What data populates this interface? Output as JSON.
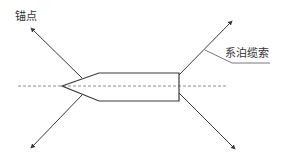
{
  "diagram": {
    "type": "mooring-schematic",
    "labels": {
      "anchor_point": "锚点",
      "mooring_cable": "系泊缆索"
    },
    "colors": {
      "line": "#3a3a3a",
      "centerline": "#6f6f6f",
      "text": "#333333",
      "background": "#ffffff"
    },
    "ship": {
      "bow_tip": [
        62,
        86
      ],
      "body_top_left": [
        99,
        73
      ],
      "body_bottom_left": [
        99,
        101
      ],
      "body_top_right": [
        179,
        73
      ],
      "body_bottom_right": [
        179,
        101
      ]
    },
    "centerline": {
      "from": [
        18,
        86
      ],
      "to": [
        228,
        86
      ],
      "style": "dashed"
    },
    "mooring_lines": [
      {
        "name": "front-upper",
        "from": [
          82,
          78
        ],
        "to": [
          31,
          28
        ]
      },
      {
        "name": "front-lower",
        "from": [
          82,
          95
        ],
        "to": [
          31,
          148
        ]
      },
      {
        "name": "rear-upper",
        "from": [
          179,
          75
        ],
        "to": [
          232,
          21
        ]
      },
      {
        "name": "rear-lower",
        "from": [
          179,
          93
        ],
        "to": [
          235,
          149
        ]
      }
    ],
    "callout": {
      "points": [
        [
          205,
          50
        ],
        [
          232,
          63
        ],
        [
          270,
          63
        ]
      ]
    }
  }
}
